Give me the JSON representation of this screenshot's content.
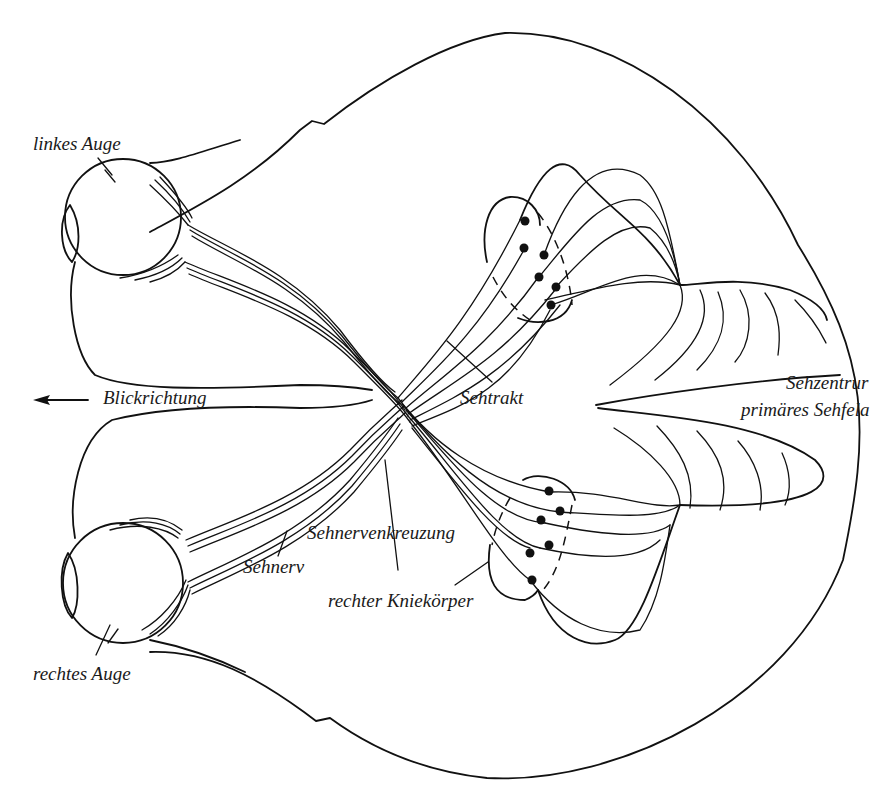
{
  "diagram": {
    "colors": {
      "line": "#111111",
      "background": "#ffffff",
      "text": "#1a1a1a"
    },
    "labels": {
      "left_eye": "linkes Auge",
      "right_eye": "rechtes Auge",
      "gaze_direction": "Blickrichtung",
      "optic_tract": "Sehtrakt",
      "visual_center": "Sehzentrum",
      "primary_visual_field": "primäres Sehfeld",
      "optic_chiasm": "Sehnervenkreuzung",
      "optic_nerve": "Sehnerv",
      "right_lgn": "rechter Kniekörper"
    },
    "visible_label_text": {
      "visual_center": "Sehzentrur",
      "primary_visual_field": "primäres Sehfela"
    },
    "icons": {
      "gaze_arrow": "arrow-left-icon"
    }
  }
}
